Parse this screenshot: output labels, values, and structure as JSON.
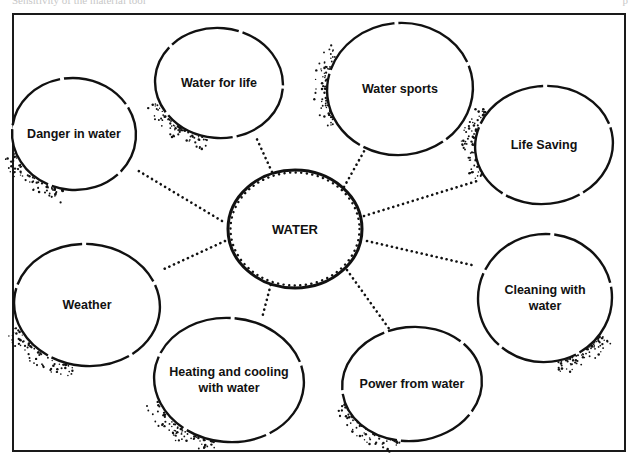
{
  "header": {
    "left_text": "Sensitivity of the material tool",
    "right_text": "p"
  },
  "colors": {
    "ink": "#111111",
    "paper": "#ffffff",
    "frame": "#1a1a1a"
  },
  "frame": {
    "x": 13,
    "y": 14,
    "width": 612,
    "height": 437
  },
  "center": {
    "label": "WATER",
    "cx": 295,
    "cy": 229,
    "rx": 67,
    "ry": 59
  },
  "nodes": [
    {
      "id": "water-for-life",
      "label": "Water for life",
      "lines": [
        "Water for life"
      ],
      "cx": 219,
      "cy": 83,
      "rx": 64,
      "ry": 55,
      "shade": "bl"
    },
    {
      "id": "water-sports",
      "label": "Water sports",
      "lines": [
        "Water sports"
      ],
      "cx": 400,
      "cy": 89,
      "rx": 73,
      "ry": 66,
      "shade": "l"
    },
    {
      "id": "danger-in-water",
      "label": "Danger in water",
      "lines": [
        "Danger in water"
      ],
      "cx": 74,
      "cy": 134,
      "rx": 62,
      "ry": 56,
      "shade": "bl"
    },
    {
      "id": "life-saving",
      "label": "Life Saving",
      "lines": [
        "Life Saving"
      ],
      "cx": 544,
      "cy": 145,
      "rx": 69,
      "ry": 59,
      "shade": "l"
    },
    {
      "id": "weather",
      "label": "Weather",
      "lines": [
        "Weather"
      ],
      "cx": 87,
      "cy": 305,
      "rx": 73,
      "ry": 61,
      "shade": "bl"
    },
    {
      "id": "cleaning-with-water",
      "label": "Cleaning with water",
      "lines": [
        "Cleaning with",
        "water"
      ],
      "cx": 545,
      "cy": 298,
      "rx": 67,
      "ry": 64,
      "shade": "br"
    },
    {
      "id": "heating-and-cooling",
      "label": "Heating and cooling with water",
      "lines": [
        "Heating and cooling",
        "with water"
      ],
      "cx": 229,
      "cy": 380,
      "rx": 75,
      "ry": 62,
      "shade": "bl"
    },
    {
      "id": "power-from-water",
      "label": "Power from water",
      "lines": [
        "Power from water"
      ],
      "cx": 412,
      "cy": 384,
      "rx": 70,
      "ry": 57,
      "shade": "bl"
    }
  ],
  "connectors": [
    {
      "to": "water-for-life",
      "x1": 272,
      "y1": 172,
      "x2": 255,
      "y2": 135
    },
    {
      "to": "water-sports",
      "x1": 344,
      "y1": 187,
      "x2": 367,
      "y2": 146
    },
    {
      "to": "danger-in-water",
      "x1": 222,
      "y1": 221,
      "x2": 137,
      "y2": 170
    },
    {
      "to": "life-saving",
      "x1": 364,
      "y1": 216,
      "x2": 477,
      "y2": 181
    },
    {
      "to": "weather",
      "x1": 225,
      "y1": 241,
      "x2": 162,
      "y2": 270
    },
    {
      "to": "cleaning-with-water",
      "x1": 367,
      "y1": 241,
      "x2": 476,
      "y2": 266
    },
    {
      "to": "heating-and-cooling",
      "x1": 272,
      "y1": 280,
      "x2": 262,
      "y2": 318
    },
    {
      "to": "power-from-water",
      "x1": 347,
      "y1": 270,
      "x2": 390,
      "y2": 330
    }
  ]
}
